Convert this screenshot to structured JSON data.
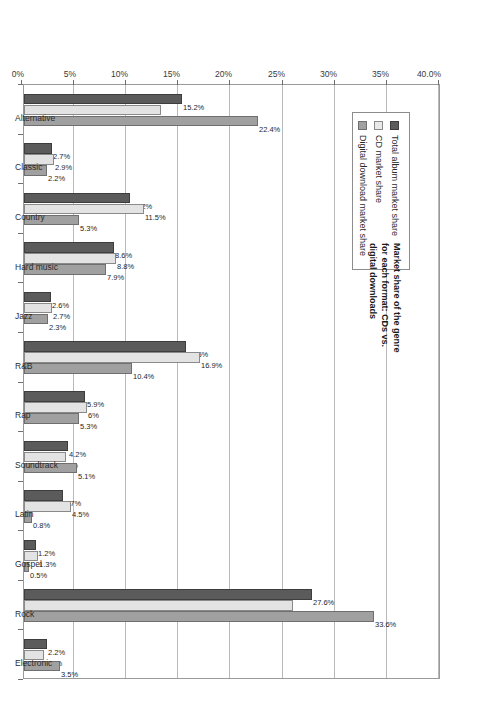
{
  "chart_data": {
    "type": "bar",
    "title": "",
    "annotation": "Market share of the genre for each format: CDs vs. digital downloads",
    "xlabel": "",
    "ylabel": "",
    "ylim": [
      0,
      40
    ],
    "grid": true,
    "orientation": "vertical-bars-rotated-page",
    "legend_position": "upper-left-inside",
    "ytick_labels": [
      "0%",
      "5%",
      "10%",
      "15%",
      "20%",
      "25%",
      "30%",
      "35%",
      "40.0%"
    ],
    "ytick_values": [
      0,
      5,
      10,
      15,
      20,
      25,
      30,
      35,
      40
    ],
    "categories": [
      "Alternative",
      "Classic",
      "Country",
      "Hard music",
      "Jazz",
      "R&B",
      "Rap",
      "Soundtrack",
      "Latin",
      "Gospel",
      "Rock",
      "Electronic"
    ],
    "series": [
      {
        "name": "Total album market share",
        "color": "#5b5b5b",
        "values": [
          15.2,
          2.7,
          10.2,
          8.6,
          2.6,
          15.5,
          5.9,
          4.2,
          3.7,
          1.2,
          27.6,
          2.2
        ],
        "labels": [
          "15.2%",
          "2.7%",
          "10.2%",
          "8.6%",
          "2.6%",
          "15.5%",
          "5.9%",
          "4.2%",
          "3.7%",
          "1.2%",
          "27.6%",
          "2.2%"
        ]
      },
      {
        "name": "CD market share",
        "color": "#e3e3e3",
        "values": [
          13.1,
          2.9,
          11.5,
          8.8,
          2.7,
          16.9,
          6.0,
          4.0,
          4.5,
          1.3,
          25.8,
          1.9
        ],
        "labels": [
          "13.1%",
          "2.9%",
          "11.5%",
          "8.8%",
          "2.7%",
          "16.9%",
          "6%",
          "4%",
          "4.5%",
          "1.3%",
          "25.8%",
          "1.9%"
        ]
      },
      {
        "name": "Digital download market share",
        "color": "#a0a0a0",
        "values": [
          22.4,
          2.2,
          5.3,
          7.9,
          2.3,
          10.4,
          5.3,
          5.1,
          0.8,
          0.5,
          33.6,
          3.5
        ],
        "labels": [
          "22.4%",
          "2.2%",
          "5.3%",
          "7.9%",
          "2.3%",
          "10.4%",
          "5.3%",
          "5.1%",
          "0.8%",
          "0.5%",
          "33.6%",
          "3.5%"
        ]
      }
    ]
  }
}
